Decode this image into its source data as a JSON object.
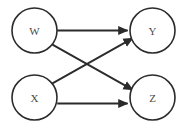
{
  "diagram": {
    "type": "directed-graph",
    "background_color": "#ffffff",
    "node_stroke_color": "#2b2b2b",
    "node_fill_color": "#ffffff",
    "edge_color": "#2b2b2b",
    "label_color": "#4a4a4a",
    "nodes": [
      {
        "id": "W",
        "label": "W",
        "cx": 34.5,
        "cy": 30.5,
        "r": 22.5
      },
      {
        "id": "Y",
        "label": "Y",
        "cx": 152.5,
        "cy": 30.5,
        "r": 22.5
      },
      {
        "id": "X",
        "label": "X",
        "cx": 34.5,
        "cy": 97.5,
        "r": 22.5
      },
      {
        "id": "Z",
        "label": "Z",
        "cx": 152.5,
        "cy": 97.5,
        "r": 22.5
      }
    ],
    "edges": [
      {
        "id": "w-to-y",
        "from": "W",
        "to": "Y",
        "shape": "horizontal",
        "arrow": true
      },
      {
        "id": "w-to-z",
        "from": "W",
        "to": "Z",
        "shape": "diagonal-down",
        "arrow": true
      },
      {
        "id": "x-to-y",
        "from": "X",
        "to": "Y",
        "shape": "diagonal-up",
        "arrow": true
      },
      {
        "id": "x-to-z",
        "from": "X",
        "to": "Z",
        "shape": "horizontal",
        "arrow": true
      }
    ]
  }
}
